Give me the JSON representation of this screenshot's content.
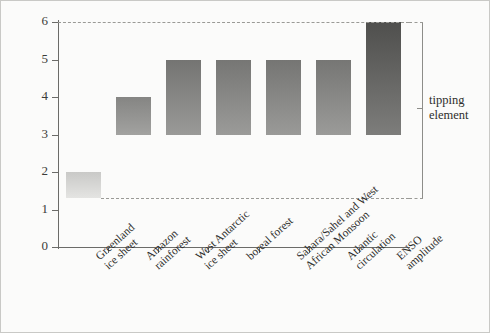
{
  "chart_data": {
    "type": "bar",
    "title": "",
    "xlabel": "",
    "ylabel": "global warming threshold/°C",
    "ylim": [
      0,
      6
    ],
    "yticks": [
      0,
      1,
      2,
      3,
      4,
      5,
      6
    ],
    "ytick_labels": [
      "0",
      "1",
      "2",
      "3",
      "4",
      "5",
      "6"
    ],
    "grid": false,
    "legend_position": "right",
    "categories": [
      "Greenland ice sheet",
      "Amazon rainforest",
      "West Antarctic ice sheet",
      "boreal forest",
      "Sahara/Sahel and West African Monsoon",
      "Atlantic circulation",
      "ENSO amplitude"
    ],
    "category_lines": [
      [
        "Greenland",
        "ice sheet"
      ],
      [
        "Amazon",
        "rainforest"
      ],
      [
        "West Antarctic",
        "ice sheet"
      ],
      [
        "boreal forest"
      ],
      [
        "Sahara/Sahel and West",
        "African Monsoon"
      ],
      [
        "Atlantic",
        "circulation"
      ],
      [
        "ENSO",
        "amplitude"
      ]
    ],
    "bars": [
      {
        "category": "Greenland ice sheet",
        "low": 1.3,
        "high": 2.0,
        "color_top": "#c9c9c7",
        "color_bottom": "#e4e4e2"
      },
      {
        "category": "Amazon rainforest",
        "low": 3.0,
        "high": 4.0,
        "color_top": "#858583",
        "color_bottom": "#a2a2a0"
      },
      {
        "category": "West Antarctic ice sheet",
        "low": 3.0,
        "high": 5.0,
        "color_top": "#747472",
        "color_bottom": "#9a9a98"
      },
      {
        "category": "boreal forest",
        "low": 3.0,
        "high": 5.0,
        "color_top": "#767674",
        "color_bottom": "#9b9b99"
      },
      {
        "category": "Sahara/Sahel and West African Monsoon",
        "low": 3.0,
        "high": 5.0,
        "color_top": "#757573",
        "color_bottom": "#9a9a98"
      },
      {
        "category": "Atlantic circulation",
        "low": 3.0,
        "high": 5.0,
        "color_top": "#767674",
        "color_bottom": "#9b9b99"
      },
      {
        "category": "ENSO amplitude",
        "low": 3.0,
        "high": 6.0,
        "color_top": "#4f4f4d",
        "color_bottom": "#7d7d7b"
      }
    ],
    "annotations": [
      {
        "name": "upper-threshold-dashed-line",
        "y": 6.0,
        "style": "dashed"
      },
      {
        "name": "lower-threshold-dashed-line",
        "y": 1.3,
        "style": "dashed"
      }
    ],
    "legend": {
      "label_lines": [
        "tipping",
        "element"
      ],
      "label": "tipping element"
    }
  }
}
